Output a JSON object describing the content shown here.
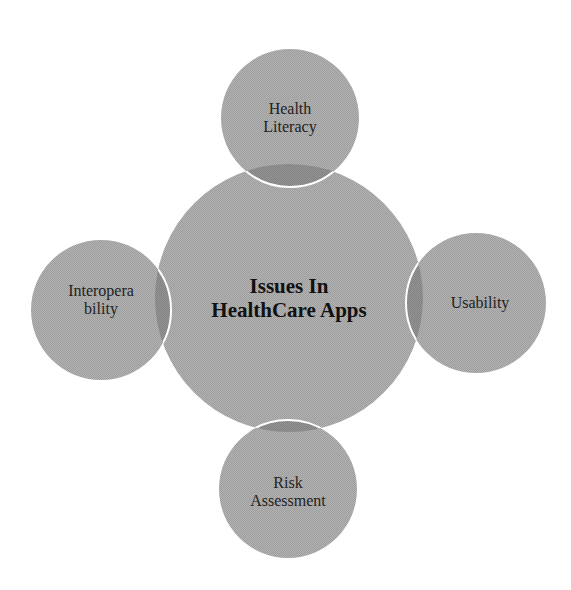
{
  "diagram": {
    "type": "radial-venn",
    "center": {
      "label_lines": [
        "Issues In",
        "HealthCare Apps"
      ],
      "cx": 289,
      "cy": 298,
      "r": 134
    },
    "satellites": [
      {
        "id": "health-literacy",
        "label_lines": [
          "Health",
          "Literacy"
        ],
        "cx": 290,
        "cy": 118,
        "r": 69
      },
      {
        "id": "usability",
        "label_lines": [
          "Usability"
        ],
        "cx": 476,
        "cy": 303,
        "r": 70
      },
      {
        "id": "risk-assessment",
        "label_lines": [
          "Risk",
          "Assessment"
        ],
        "cx": 288,
        "cy": 489,
        "r": 69
      },
      {
        "id": "interoperability",
        "label_lines": [
          "Interopera",
          "bility"
        ],
        "cx": 101,
        "cy": 310,
        "r": 70
      }
    ],
    "colors": {
      "fill": "#a9a9a9",
      "overlap": "#8c8c8c",
      "outline": "#ffffff",
      "text": "#1a1a1a",
      "background": "#ffffff"
    }
  }
}
